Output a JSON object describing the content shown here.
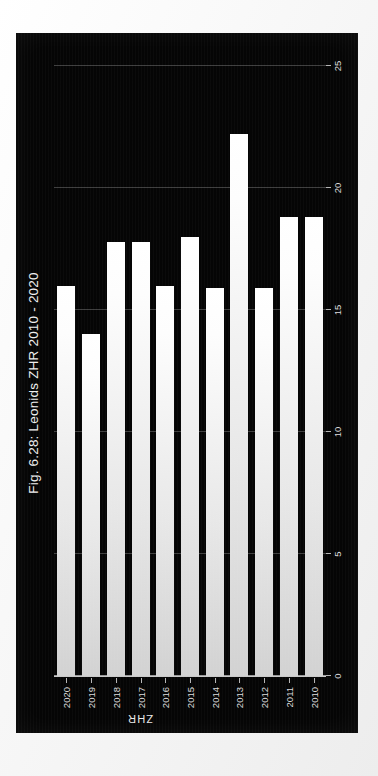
{
  "figure": {
    "title": "Fig. 6.28: Leonids ZHR 2010 - 2020",
    "background_color": "#050505",
    "bar_color": "#f2f2f2",
    "grid_color": "#4a4a4a",
    "text_color": "#dcdcdc"
  },
  "chart_data": {
    "type": "bar",
    "orientation": "horizontal",
    "title": "Fig. 6.28: Leonids ZHR 2010 - 2020",
    "xlabel": "",
    "ylabel": "ZHR",
    "categories": [
      "2010",
      "2011",
      "2012",
      "2013",
      "2014",
      "2015",
      "2016",
      "2017",
      "2018",
      "2019",
      "2020"
    ],
    "values": [
      18.8,
      18.8,
      15.9,
      22.2,
      15.9,
      18.0,
      16.0,
      17.8,
      17.8,
      14.0,
      16.0
    ],
    "value_ticks": [
      "0",
      "5",
      "10",
      "15",
      "20",
      "25"
    ],
    "value_tick_numbers": [
      0,
      5,
      10,
      15,
      20,
      25
    ],
    "ylim": [
      0,
      25
    ],
    "grid": true,
    "legend": false,
    "series": [
      {
        "name": "Leonids ZHR",
        "values": [
          18.8,
          18.8,
          15.9,
          22.2,
          15.9,
          18.0,
          16.0,
          17.8,
          17.8,
          14.0,
          16.0
        ]
      }
    ]
  }
}
